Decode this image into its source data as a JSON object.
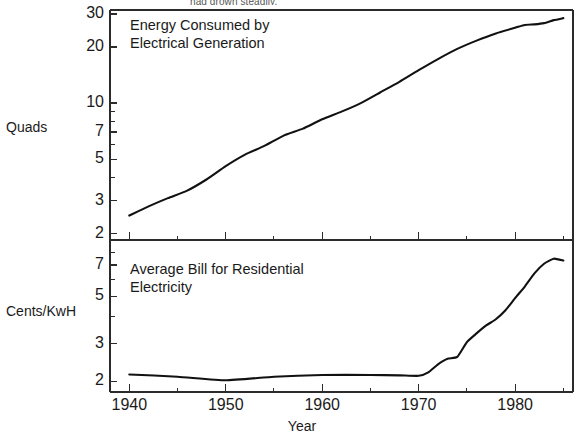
{
  "figure": {
    "cut_off_caption": "had grown steadily.",
    "xaxis_title": "Year",
    "x_ticks": [
      "1940",
      "1950",
      "1960",
      "1970",
      "1980"
    ],
    "x_tick_values": [
      1940,
      1950,
      1960,
      1970,
      1980
    ],
    "x_minor_values": [
      1945,
      1955,
      1965,
      1975,
      1985
    ],
    "xlim": [
      1938,
      1986
    ]
  },
  "panels": {
    "top": {
      "axis_label": "Quads",
      "title_line1": "Energy Consumed by",
      "title_line2": "Electrical Generation",
      "y_ticks": [
        "30",
        "20",
        "10",
        "7",
        "5",
        "3",
        "2"
      ],
      "y_tick_values": [
        30,
        20,
        10,
        7,
        5,
        3,
        2
      ]
    },
    "bottom": {
      "axis_label": "Cents/KwH",
      "title_line1": "Average Bill for Residential",
      "title_line2": "Electricity",
      "y_ticks": [
        "7",
        "5",
        "3",
        "2"
      ],
      "y_tick_values": [
        7,
        5,
        3,
        2
      ]
    }
  },
  "chart_data": [
    {
      "type": "line",
      "title": "Energy Consumed by Electrical Generation",
      "xlabel": "Year",
      "ylabel": "Quads",
      "yscale": "log",
      "ylim": [
        1.85,
        31.5
      ],
      "xlim": [
        1938,
        1986
      ],
      "grid": false,
      "legend": "none",
      "x": [
        1940,
        1942,
        1944,
        1946,
        1948,
        1950,
        1952,
        1954,
        1956,
        1958,
        1960,
        1962,
        1964,
        1966,
        1968,
        1970,
        1972,
        1974,
        1976,
        1978,
        1980,
        1981,
        1982,
        1983,
        1984,
        1985
      ],
      "values": [
        2.5,
        2.8,
        3.1,
        3.4,
        3.9,
        4.6,
        5.3,
        5.9,
        6.7,
        7.3,
        8.2,
        9.0,
        10.0,
        11.4,
        13.0,
        15.0,
        17.2,
        19.5,
        21.6,
        23.6,
        25.3,
        26.2,
        26.4,
        26.8,
        27.8,
        28.5
      ]
    },
    {
      "type": "line",
      "title": "Average Bill for Residential Electricity",
      "xlabel": "Year",
      "ylabel": "Cents/KwH",
      "yscale": "log",
      "ylim": [
        1.78,
        8.6
      ],
      "xlim": [
        1938,
        1986
      ],
      "grid": false,
      "legend": "none",
      "x": [
        1940,
        1945,
        1950,
        1955,
        1960,
        1965,
        1968,
        1970,
        1971,
        1972,
        1973,
        1974,
        1975,
        1976,
        1977,
        1978,
        1979,
        1980,
        1981,
        1982,
        1983,
        1984,
        1985
      ],
      "values": [
        2.15,
        2.1,
        2.02,
        2.1,
        2.14,
        2.14,
        2.13,
        2.12,
        2.2,
        2.4,
        2.55,
        2.6,
        3.05,
        3.35,
        3.65,
        3.9,
        4.3,
        4.9,
        5.55,
        6.4,
        7.1,
        7.5,
        7.35
      ]
    }
  ]
}
